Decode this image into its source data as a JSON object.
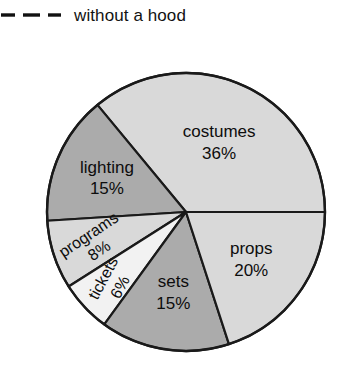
{
  "legend": {
    "line_style": "dashed",
    "dash_segments": 3,
    "label": "without a hood",
    "color": "#111111"
  },
  "chart_data": {
    "type": "pie",
    "title": "",
    "subtitle": "",
    "xlabel": "",
    "ylabel": "",
    "legend_position": "top-left",
    "grid": false,
    "units": "percent",
    "total": 100,
    "categories": [
      "costumes",
      "props",
      "sets",
      "tickets",
      "programs",
      "lighting"
    ],
    "values": [
      36,
      20,
      15,
      6,
      8,
      15
    ],
    "labels": [
      "costumes",
      "props",
      "sets",
      "tickets",
      "programs",
      "lighting"
    ],
    "value_labels": [
      "36%",
      "20%",
      "15%",
      "6%",
      "8%",
      "15%"
    ],
    "colors": [
      "#d9d9d9",
      "#d9d9d9",
      "#ababab",
      "#f2f2f2",
      "#d9d9d9",
      "#ababab"
    ],
    "stroke_color": "#1a1a1a",
    "start_angle_deg": 0,
    "direction": "counterclockwise",
    "slices": [
      {
        "name": "costumes",
        "percent": 36,
        "value_label": "36%",
        "fill": "#d9d9d9",
        "label_rotation_deg": 0
      },
      {
        "name": "lighting",
        "percent": 15,
        "value_label": "15%",
        "fill": "#ababab",
        "label_rotation_deg": 0
      },
      {
        "name": "programs",
        "percent": 8,
        "value_label": "8%",
        "fill": "#d9d9d9",
        "label_rotation_deg": -34
      },
      {
        "name": "tickets",
        "percent": 6,
        "value_label": "6%",
        "fill": "#f2f2f2",
        "label_rotation_deg": -62
      },
      {
        "name": "sets",
        "percent": 15,
        "value_label": "15%",
        "fill": "#ababab",
        "label_rotation_deg": 0
      },
      {
        "name": "props",
        "percent": 20,
        "value_label": "20%",
        "fill": "#d9d9d9",
        "label_rotation_deg": 0
      }
    ]
  },
  "geometry": {
    "center_x": 186,
    "center_y": 212,
    "radius": 139
  }
}
